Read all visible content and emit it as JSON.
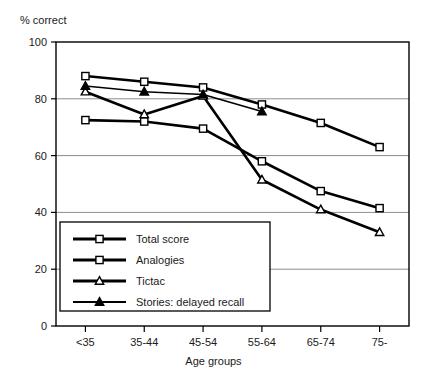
{
  "chart_data": {
    "type": "line",
    "title": "",
    "xlabel": "Age groups",
    "ylabel": "% correct",
    "categories": [
      "<35",
      "35-44",
      "45-54",
      "55-64",
      "65-74",
      "75-"
    ],
    "ylim": [
      0,
      100
    ],
    "yticks": [
      0,
      20,
      40,
      60,
      80,
      100
    ],
    "grid": "horizontal",
    "legend_position": "lower-left-inside",
    "series": [
      {
        "name": "Total score",
        "marker": "open-square",
        "color": "#000000",
        "values": [
          88,
          86,
          84,
          78,
          71.5,
          63
        ]
      },
      {
        "name": "Analogies",
        "marker": "open-square",
        "color": "#000000",
        "values": [
          72.5,
          72,
          69.5,
          58,
          47.5,
          41.5
        ]
      },
      {
        "name": "Tictac",
        "marker": "open-triangle",
        "color": "#000000",
        "values": [
          82.5,
          74.5,
          81,
          51.5,
          41,
          33
        ]
      },
      {
        "name": "Stories: delayed recall",
        "marker": "filled-triangle",
        "color": "#000000",
        "values": [
          84.5,
          82.5,
          81.5,
          75.5,
          null,
          null
        ]
      }
    ]
  },
  "axis": {
    "y_title": "% correct",
    "x_title": "Age groups",
    "y_tick_labels": [
      "0",
      "20",
      "40",
      "60",
      "80",
      "100"
    ],
    "x_tick_labels": [
      "<35",
      "35-44",
      "45-54",
      "55-64",
      "65-74",
      "75-"
    ]
  },
  "legend": {
    "items": [
      {
        "label": "Total score",
        "marker": "open-square"
      },
      {
        "label": "Analogies",
        "marker": "open-square"
      },
      {
        "label": "Tictac",
        "marker": "open-triangle"
      },
      {
        "label": "Stories: delayed recall",
        "marker": "filled-triangle"
      }
    ]
  },
  "colors": {
    "line": "#000000",
    "grid": "#8c8c8c",
    "frame": "#000000",
    "text": "#1a1a1a",
    "background": "#ffffff"
  }
}
